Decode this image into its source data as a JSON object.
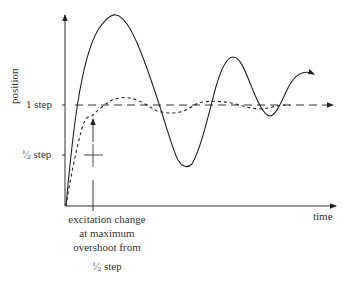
{
  "diagram": {
    "type": "step-motor position response",
    "axes": {
      "y_label": "position",
      "x_label": "time",
      "y_ticks": [
        {
          "label": "1 step",
          "level": 1.0
        },
        {
          "label": "½ step",
          "label_num": "1",
          "label_den": "2",
          "label_unit": "step",
          "level": 0.5
        }
      ]
    },
    "curves": [
      {
        "name": "uncontrolled-oscillation",
        "style": "solid",
        "description": "large overshoot oscillating about 1 step"
      },
      {
        "name": "controlled-response",
        "style": "short-dashed",
        "description": "small overshoot settling near 1 step"
      },
      {
        "name": "target-level",
        "style": "long-dashed",
        "description": "1 step reference with arrow"
      }
    ],
    "annotation": {
      "line1": "excitation change",
      "line2": "at maximum",
      "line3": "overshoot from",
      "line4_num": "1",
      "line4_den": "2",
      "line4_unit": "step"
    },
    "colors": {
      "stroke": "#222222",
      "background": "#ffffff"
    }
  }
}
